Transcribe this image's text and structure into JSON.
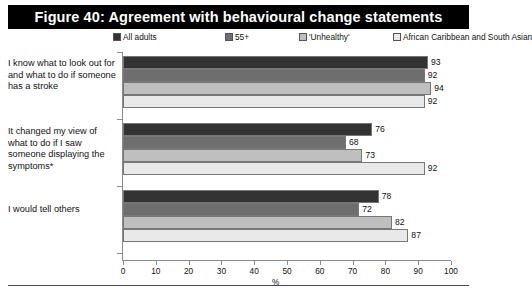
{
  "figure": {
    "title": "Figure 40: Agreement with behavioural change statements"
  },
  "legend": {
    "position": "top",
    "items": [
      {
        "label": "All adults",
        "color": "#333333",
        "left": 0
      },
      {
        "label": "55+",
        "color": "#6e6e6e",
        "left": 112
      },
      {
        "label": "'Unhealthy'",
        "color": "#bfbfbf",
        "left": 186
      },
      {
        "label": "African Caribbean and South Asian",
        "color": "#e9e9e9",
        "left": 280
      }
    ]
  },
  "axis": {
    "x_title": "%",
    "x_min": 0,
    "x_max": 100,
    "x_ticks": [
      0,
      10,
      20,
      30,
      40,
      50,
      60,
      70,
      80,
      90,
      100
    ]
  },
  "chart_data": {
    "type": "bar",
    "orientation": "horizontal",
    "title": "Figure 40: Agreement with behavioural change statements",
    "xlabel": "%",
    "ylabel": "",
    "xlim": [
      0,
      100
    ],
    "grid": false,
    "legend_position": "top",
    "categories": [
      "I know what to look out for and what to do if someone has a stroke",
      "It changed my view of what to do if I saw someone displaying the symptoms*",
      "I would tell others"
    ],
    "series": [
      {
        "name": "All adults",
        "color": "#333333",
        "values": [
          93,
          76,
          78
        ]
      },
      {
        "name": "55+",
        "color": "#6e6e6e",
        "values": [
          92,
          68,
          72
        ]
      },
      {
        "name": "'Unhealthy'",
        "color": "#bfbfbf",
        "values": [
          94,
          73,
          82
        ]
      },
      {
        "name": "African Caribbean and South Asian",
        "color": "#e9e9e9",
        "values": [
          92,
          92,
          87
        ]
      }
    ]
  }
}
